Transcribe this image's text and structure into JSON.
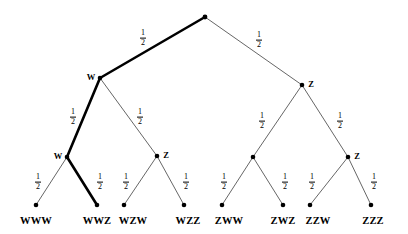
{
  "diagram": {
    "type": "probability-tree",
    "levels": 3,
    "edge_probability": "1/2",
    "fraction": {
      "numerator": "1",
      "denominator": "2"
    },
    "colors": {
      "background": "#ffffff",
      "line": "#555555",
      "line_highlight": "#000000",
      "node": "#000000",
      "text": "#000000"
    },
    "root": {
      "id": "root",
      "label": "",
      "x": 205,
      "y": 17
    },
    "nodes": [
      {
        "id": "W",
        "label": "W",
        "x": 100,
        "y": 78,
        "label_side": "left"
      },
      {
        "id": "Z",
        "label": "Z",
        "x": 302,
        "y": 85,
        "label_side": "right"
      },
      {
        "id": "WW",
        "label": "W",
        "x": 67,
        "y": 157,
        "label_side": "left"
      },
      {
        "id": "WZ",
        "label": "Z",
        "x": 157,
        "y": 156,
        "label_side": "right"
      },
      {
        "id": "ZW",
        "label": "",
        "x": 253,
        "y": 157,
        "label_side": "right"
      },
      {
        "id": "ZZ",
        "label": "Z",
        "x": 348,
        "y": 157,
        "label_side": "right"
      }
    ],
    "edges": [
      {
        "id": "e-root-W",
        "from": "root",
        "to": "W",
        "x1": 205,
        "y1": 17,
        "x2": 100,
        "y2": 78,
        "probability": "1/2",
        "highlighted": true,
        "label_x": 143,
        "label_y": 38
      },
      {
        "id": "e-root-Z",
        "from": "root",
        "to": "Z",
        "x1": 205,
        "y1": 17,
        "x2": 302,
        "y2": 85,
        "probability": "1/2",
        "highlighted": false,
        "label_x": 259,
        "label_y": 40
      },
      {
        "id": "e-W-WW",
        "from": "W",
        "to": "WW",
        "x1": 100,
        "y1": 78,
        "x2": 67,
        "y2": 157,
        "probability": "1/2",
        "highlighted": true,
        "label_x": 73,
        "label_y": 117
      },
      {
        "id": "e-W-WZ",
        "from": "W",
        "to": "WZ",
        "x1": 100,
        "y1": 78,
        "x2": 157,
        "y2": 156,
        "probability": "1/2",
        "highlighted": false,
        "label_x": 140,
        "label_y": 117
      },
      {
        "id": "e-Z-ZW",
        "from": "Z",
        "to": "ZW",
        "x1": 302,
        "y1": 85,
        "x2": 253,
        "y2": 157,
        "probability": "1/2",
        "highlighted": false,
        "label_x": 262,
        "label_y": 121
      },
      {
        "id": "e-Z-ZZ",
        "from": "Z",
        "to": "ZZ",
        "x1": 302,
        "y1": 85,
        "x2": 348,
        "y2": 157,
        "probability": "1/2",
        "highlighted": false,
        "label_x": 340,
        "label_y": 121
      },
      {
        "id": "e-WW-WWW",
        "from": "WW",
        "to": "WWW",
        "x1": 67,
        "y1": 157,
        "x2": 36,
        "y2": 205,
        "probability": "1/2",
        "highlighted": false,
        "label_x": 38,
        "label_y": 182
      },
      {
        "id": "e-WW-WWZ",
        "from": "WW",
        "to": "WWZ",
        "x1": 67,
        "y1": 157,
        "x2": 97,
        "y2": 205,
        "probability": "1/2",
        "highlighted": true,
        "label_x": 100,
        "label_y": 182
      },
      {
        "id": "e-WZ-WZW",
        "from": "WZ",
        "to": "WZW",
        "x1": 157,
        "y1": 156,
        "x2": 124,
        "y2": 205,
        "probability": "1/2",
        "highlighted": false,
        "label_x": 126,
        "label_y": 182
      },
      {
        "id": "e-WZ-WZZ",
        "from": "WZ",
        "to": "WZZ",
        "x1": 157,
        "y1": 156,
        "x2": 184,
        "y2": 205,
        "probability": "1/2",
        "highlighted": false,
        "label_x": 186,
        "label_y": 182
      },
      {
        "id": "e-ZW-ZWW",
        "from": "ZW",
        "to": "ZWW",
        "x1": 253,
        "y1": 157,
        "x2": 222,
        "y2": 205,
        "probability": "1/2",
        "highlighted": false,
        "label_x": 224,
        "label_y": 182
      },
      {
        "id": "e-ZW-ZWZ",
        "from": "ZW",
        "to": "ZWZ",
        "x1": 253,
        "y1": 157,
        "x2": 283,
        "y2": 205,
        "probability": "1/2",
        "highlighted": false,
        "label_x": 285,
        "label_y": 182
      },
      {
        "id": "e-ZZ-ZZW",
        "from": "ZZ",
        "to": "ZZW",
        "x1": 348,
        "y1": 157,
        "x2": 310,
        "y2": 205,
        "probability": "1/2",
        "highlighted": false,
        "label_x": 312,
        "label_y": 182
      },
      {
        "id": "e-ZZ-ZZZ",
        "from": "ZZ",
        "to": "ZZZ",
        "x1": 348,
        "y1": 157,
        "x2": 371,
        "y2": 205,
        "probability": "1/2",
        "highlighted": false,
        "label_x": 374,
        "label_y": 182
      }
    ],
    "leaves": [
      {
        "id": "WWW",
        "label": "WWW",
        "x": 36,
        "y": 205,
        "label_x": 36,
        "label_y": 216,
        "highlighted": false
      },
      {
        "id": "WWZ",
        "label": "WWZ",
        "x": 97,
        "y": 205,
        "label_x": 97,
        "label_y": 216,
        "highlighted": true
      },
      {
        "id": "WZW",
        "label": "WZW",
        "x": 124,
        "y": 205,
        "label_x": 133,
        "label_y": 216,
        "highlighted": false
      },
      {
        "id": "WZZ",
        "label": "WZZ",
        "x": 184,
        "y": 205,
        "label_x": 188,
        "label_y": 216,
        "highlighted": false
      },
      {
        "id": "ZWW",
        "label": "ZWW",
        "x": 222,
        "y": 205,
        "label_x": 229,
        "label_y": 216,
        "highlighted": false
      },
      {
        "id": "ZWZ",
        "label": "ZWZ",
        "x": 283,
        "y": 205,
        "label_x": 283,
        "label_y": 216,
        "highlighted": false
      },
      {
        "id": "ZZW",
        "label": "ZZW",
        "x": 310,
        "y": 205,
        "label_x": 318,
        "label_y": 216,
        "highlighted": false
      },
      {
        "id": "ZZZ",
        "label": "ZZZ",
        "x": 371,
        "y": 205,
        "label_x": 373,
        "label_y": 216,
        "highlighted": false
      }
    ],
    "highlighted_path": [
      "root",
      "W",
      "WW",
      "WWZ"
    ]
  }
}
